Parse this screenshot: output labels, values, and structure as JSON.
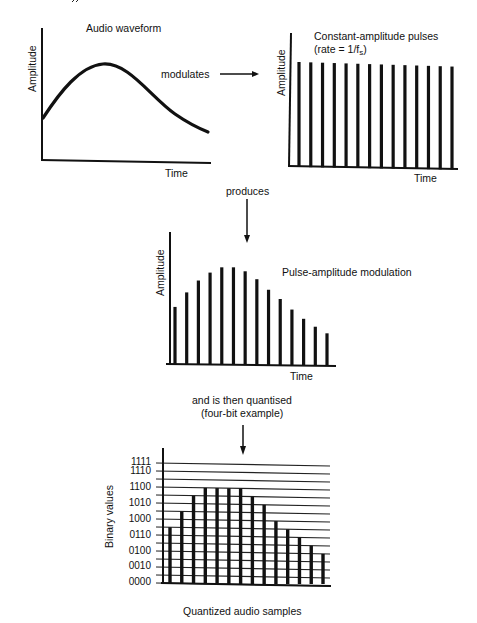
{
  "top_fragment": "ˆˆ",
  "panel1": {
    "title": "Audio waveform",
    "ylabel": "Amplitude",
    "xlabel": "Time",
    "connector_label": "modulates"
  },
  "panel2": {
    "title": "Constant-amplitude pulses",
    "subtitle_prefix": "(rate = 1/f",
    "subtitle_sub": "s",
    "subtitle_suffix": ")",
    "ylabel": "Amplitude",
    "xlabel": "Time"
  },
  "connector2_label": "produces",
  "panel3": {
    "title": "Pulse-amplitude modulation",
    "ylabel": "Amplitude",
    "xlabel": "Time"
  },
  "connector3_label_line1": "and is then quantised",
  "connector3_label_line2": "(four-bit example)",
  "panel4": {
    "ylabel": "Binary values",
    "caption": "Quantized audio samples",
    "ticks": [
      "1111",
      "1110",
      "1100",
      "1010",
      "1000",
      "0110",
      "0100",
      "0010",
      "0000"
    ]
  },
  "chart_data": [
    {
      "type": "line",
      "title": "Audio waveform",
      "xlabel": "Time",
      "ylabel": "Amplitude",
      "description": "smooth analog waveform rising to a peak then decaying",
      "x": [
        0,
        0.1,
        0.2,
        0.3,
        0.36,
        0.45,
        0.55,
        0.65,
        0.75,
        0.85,
        1.0
      ],
      "y": [
        0.32,
        0.5,
        0.63,
        0.7,
        0.72,
        0.7,
        0.6,
        0.48,
        0.36,
        0.27,
        0.22
      ],
      "grid": false
    },
    {
      "type": "bar",
      "title": "Constant-amplitude pulses (rate = 1/fs)",
      "xlabel": "Time",
      "ylabel": "Amplitude",
      "categories": [
        1,
        2,
        3,
        4,
        5,
        6,
        7,
        8,
        9,
        10,
        11,
        12,
        13,
        14
      ],
      "values": [
        1,
        1,
        1,
        1,
        1,
        1,
        1,
        1,
        1,
        1,
        1,
        1,
        1,
        1
      ],
      "grid": false
    },
    {
      "type": "bar",
      "title": "Pulse-amplitude modulation",
      "xlabel": "Time",
      "ylabel": "Amplitude",
      "categories": [
        1,
        2,
        3,
        4,
        5,
        6,
        7,
        8,
        9,
        10,
        11,
        12,
        13,
        14
      ],
      "values": [
        0.44,
        0.55,
        0.64,
        0.7,
        0.74,
        0.74,
        0.71,
        0.65,
        0.57,
        0.5,
        0.42,
        0.35,
        0.29,
        0.24
      ],
      "grid": false
    },
    {
      "type": "bar",
      "title": "Quantized audio samples",
      "xlabel": "",
      "ylabel": "Binary values",
      "categories": [
        1,
        2,
        3,
        4,
        5,
        6,
        7,
        8,
        9,
        10,
        11,
        12,
        13,
        14
      ],
      "values": [
        7,
        9,
        11,
        12,
        12,
        12,
        12,
        11,
        10,
        8,
        7,
        6,
        5,
        4
      ],
      "values_binary": [
        "0111",
        "1001",
        "1011",
        "1100",
        "1100",
        "1100",
        "1100",
        "1011",
        "1010",
        "1000",
        "0111",
        "0110",
        "0101",
        "0100"
      ],
      "ylim": [
        0,
        15
      ],
      "ytick_labels": [
        "0000",
        "0010",
        "0100",
        "0110",
        "1000",
        "1010",
        "1100",
        "1110",
        "1111"
      ],
      "grid": true
    }
  ]
}
